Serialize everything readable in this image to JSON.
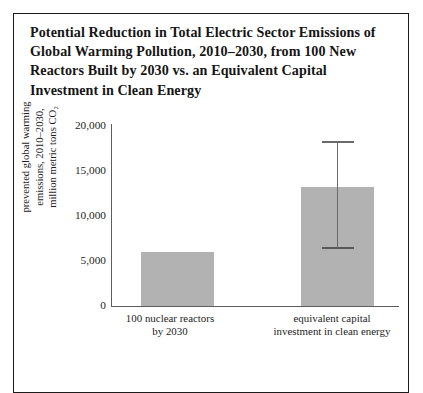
{
  "figure": {
    "title_lines": [
      "Potential Reduction in Total Electric Sector Emissions of",
      "Global Warming Pollution, 2010–2030, from 100 New",
      "Reactors Built by 2030 vs. an Equivalent Capital",
      "Investment in Clean Energy"
    ]
  },
  "axis": {
    "y_title_lines": [
      "prevented global warming",
      "emissions, 2010–2030,",
      "million metric tons CO₂"
    ],
    "y_tick_labels": [
      "20,000",
      "15,000",
      "10,000",
      "5,000",
      "0"
    ]
  },
  "colors": {
    "bar_fill": "#b2b2b2",
    "axis_line": "#5d5d5d",
    "error_bar": "#6a6a6a",
    "frame_border": "#1b1b1b",
    "text": "#1d1d1d",
    "title_text": "#161616"
  },
  "chart_data": {
    "type": "bar",
    "title": "Potential Reduction in Total Electric Sector Emissions of Global Warming Pollution, 2010–2030, from 100 New Reactors Built by 2030 vs. an Equivalent Capital Investment in Clean Energy",
    "xlabel": "",
    "ylabel": "prevented global warming emissions, 2010–2030, million metric tons CO₂",
    "ylim": [
      0,
      20000
    ],
    "yticks": [
      0,
      5000,
      10000,
      15000,
      20000
    ],
    "grid": false,
    "legend": null,
    "categories": [
      "100 nuclear reactors by 2030",
      "equivalent capital investment in clean energy"
    ],
    "category_label_lines": [
      [
        "100 nuclear reactors",
        "by 2030"
      ],
      [
        "equivalent capital",
        "investment in clean energy"
      ]
    ],
    "values": [
      6000,
      13200
    ],
    "error_bars": [
      null,
      {
        "low": 6550,
        "high": 18300
      }
    ]
  }
}
